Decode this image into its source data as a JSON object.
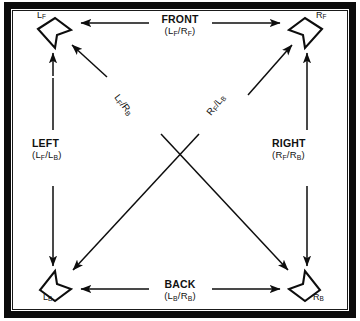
{
  "figure": {
    "type": "diagram",
    "frame": {
      "border_color": "#0b0b0b",
      "background": "#ffffff"
    }
  },
  "nodes": [
    {
      "id": "LF",
      "label_main": "L",
      "label_sub": "F",
      "position": "top-left",
      "icon": "speaker-dart-icon"
    },
    {
      "id": "RF",
      "label_main": "R",
      "label_sub": "F",
      "position": "top-right",
      "icon": "speaker-dart-icon"
    },
    {
      "id": "LB",
      "label_main": "L",
      "label_sub": "B",
      "position": "bottom-left",
      "icon": "speaker-dart-icon"
    },
    {
      "id": "RB",
      "label_main": "R",
      "label_sub": "B",
      "position": "bottom-right",
      "icon": "speaker-dart-icon"
    }
  ],
  "edges": [
    {
      "id": "front",
      "title": "FRONT",
      "pair_left": "L",
      "pair_left_sub": "F",
      "pair_right": "R",
      "pair_right_sub": "F",
      "orientation": "horizontal",
      "connects": [
        "LF",
        "RF"
      ],
      "arrows": "both"
    },
    {
      "id": "back",
      "title": "BACK",
      "pair_left": "L",
      "pair_left_sub": "B",
      "pair_right": "R",
      "pair_right_sub": "B",
      "orientation": "horizontal",
      "connects": [
        "LB",
        "RB"
      ],
      "arrows": "both"
    },
    {
      "id": "left",
      "title": "LEFT",
      "pair_left": "L",
      "pair_left_sub": "F",
      "pair_right": "L",
      "pair_right_sub": "B",
      "orientation": "vertical",
      "connects": [
        "LF",
        "LB"
      ],
      "arrows": "both"
    },
    {
      "id": "right",
      "title": "RIGHT",
      "pair_left": "R",
      "pair_left_sub": "F",
      "pair_right": "R",
      "pair_right_sub": "B",
      "orientation": "vertical",
      "connects": [
        "RF",
        "RB"
      ],
      "arrows": "both"
    },
    {
      "id": "diag-lf-rb",
      "title": "",
      "pair_left": "L",
      "pair_left_sub": "F",
      "pair_right": "R",
      "pair_right_sub": "B",
      "orientation": "diagonal-nw-se",
      "connects": [
        "LF",
        "RB"
      ],
      "arrows": "both"
    },
    {
      "id": "diag-rf-lb",
      "title": "",
      "pair_left": "R",
      "pair_left_sub": "F",
      "pair_right": "L",
      "pair_right_sub": "B",
      "orientation": "diagonal-ne-sw",
      "connects": [
        "RF",
        "LB"
      ],
      "arrows": "both"
    }
  ],
  "separator": "/"
}
